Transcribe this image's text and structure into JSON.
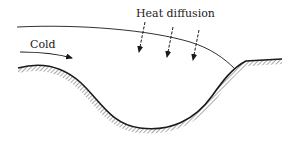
{
  "figure": {
    "labels": {
      "cold": "Cold",
      "heat_diffusion": "Heat diffusion"
    },
    "elements": {
      "flow_surface": "upper boundary of cold flow",
      "ground": "hatched valley terrain",
      "cold_flow_arrow": "arrow indicating cold air flowing into valley",
      "heat_arrows_count": 3
    },
    "colors": {
      "ink": "#1a1a1a",
      "background": "#ffffff",
      "hatch": "#555555"
    }
  }
}
